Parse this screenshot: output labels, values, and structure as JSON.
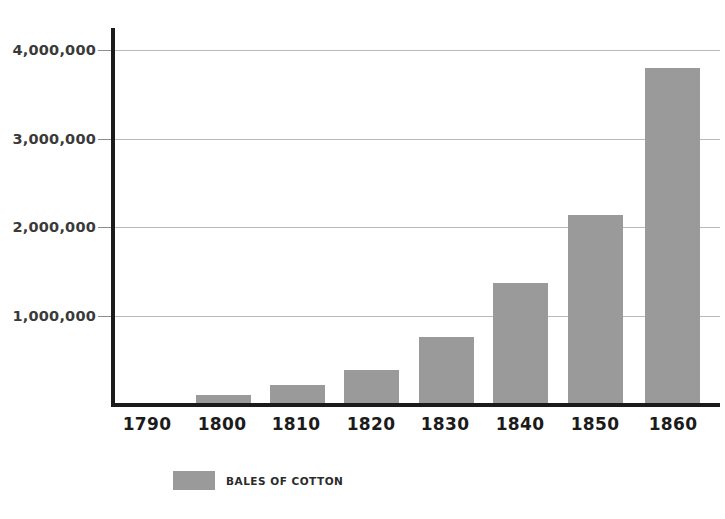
{
  "chart_data": {
    "type": "bar",
    "title": "",
    "xlabel": "",
    "ylabel": "",
    "categories": [
      "1790",
      "1800",
      "1810",
      "1820",
      "1830",
      "1840",
      "1850",
      "1860"
    ],
    "values": [
      0,
      100000,
      215000,
      380000,
      760000,
      1370000,
      2140000,
      3800000
    ],
    "series": [
      {
        "name": "BALES OF COTTON",
        "values": [
          0,
          100000,
          215000,
          380000,
          760000,
          1370000,
          2140000,
          3800000
        ]
      }
    ],
    "ylim": [
      0,
      4250000
    ],
    "ytick_values": [
      1000000,
      2000000,
      3000000,
      4000000
    ],
    "ytick_labels": [
      "1,000,000",
      "2,000,000",
      "3,000,000",
      "4,000,000"
    ],
    "grid": true,
    "legend_position": "bottom-left",
    "legend": [
      "BALES OF COTTON"
    ],
    "colors": {
      "bar": "#9a9a9a",
      "axis": "#1b1b1b",
      "gridline": "#b9b9b9",
      "background": "#ffffff",
      "ytick_text": "#3a3a3a",
      "xtick_text": "#1b1b1b"
    }
  },
  "legend": {
    "label": "BALES OF COTTON"
  },
  "axis": {
    "y_ticks": [
      {
        "label": "4,000,000",
        "value": 4000000
      },
      {
        "label": "3,000,000",
        "value": 3000000
      },
      {
        "label": "2,000,000",
        "value": 2000000
      },
      {
        "label": "1,000,000",
        "value": 1000000
      }
    ],
    "x_ticks": [
      {
        "label": "1790"
      },
      {
        "label": "1800"
      },
      {
        "label": "1810"
      },
      {
        "label": "1820"
      },
      {
        "label": "1830"
      },
      {
        "label": "1840"
      },
      {
        "label": "1850"
      },
      {
        "label": "1860"
      }
    ]
  }
}
